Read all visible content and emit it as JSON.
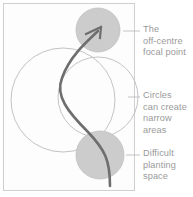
{
  "figure": {
    "frame": {
      "stroke": "#cfcfcf",
      "fill": "#fcfcfc"
    },
    "shapes": {
      "large_circle_outline": {
        "cx": 63,
        "cy": 100,
        "r": 52,
        "stroke": "#b9b9b9"
      },
      "right_circle_outline": {
        "cx": 98,
        "cy": 97,
        "r": 40,
        "stroke": "#b9b9b9"
      },
      "top_filled_circle": {
        "cx": 98,
        "cy": 30,
        "r": 22,
        "fill": "#cccccc"
      },
      "bottom_filled_circle": {
        "cx": 100,
        "cy": 155,
        "r": 24,
        "fill": "#cccccc"
      },
      "path_curve": {
        "stroke": "#6e6e6e",
        "width": 2.6
      },
      "arrow": {
        "stroke": "#6e6e6e"
      }
    },
    "colors": {
      "text": "#9a9a9a",
      "leader_line": "#b9b9b9",
      "circle_fill": "#cccccc",
      "circle_outline": "#b9b9b9",
      "path": "#6e6e6e",
      "frame": "#cfcfcf"
    },
    "leader_lines": [
      {
        "name": "focal-point",
        "x1": 123,
        "x2": 140,
        "y": 31
      },
      {
        "name": "narrow-areas",
        "x1": 128,
        "x2": 140,
        "y": 97
      },
      {
        "name": "planting-space",
        "x1": 126,
        "x2": 140,
        "y": 155
      }
    ]
  },
  "labels": {
    "focal_point": "The\noff-centre\nfocal point",
    "narrow_areas": "Circles\ncan create\nnarrow\nareas",
    "planting_space": "Difficult\nplanting\nspace"
  }
}
